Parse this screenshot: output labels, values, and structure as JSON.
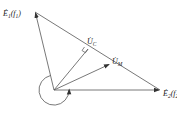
{
  "diagram": {
    "type": "phasor-diagram",
    "colors": {
      "stroke": "#444444",
      "text": "#222222",
      "background": "#ffffff"
    },
    "labels": {
      "e1": {
        "main": "Ė",
        "sub": "1",
        "suffix": "(f",
        "suffix_sub": "1",
        "close": ")"
      },
      "e2": {
        "main": "Ė",
        "sub": "2",
        "suffix": "(f",
        "suffix_sub": "2",
        "close": ")"
      },
      "uc": {
        "main": "U̇",
        "sub": "C"
      },
      "um": {
        "main": "U̇",
        "sub": "M"
      }
    },
    "vectors": [
      {
        "name": "E1",
        "from": [
          54,
          90
        ],
        "to": [
          35,
          12
        ]
      },
      {
        "name": "E2",
        "from": [
          54,
          90
        ],
        "to": [
          160,
          90
        ]
      },
      {
        "name": "UC",
        "from": [
          54,
          90
        ],
        "to": [
          88,
          49
        ]
      },
      {
        "name": "UM",
        "from": [
          54,
          90
        ],
        "to": [
          110,
          64
        ]
      }
    ],
    "connector": {
      "from": [
        35,
        12
      ],
      "to": [
        160,
        90
      ]
    },
    "rotation_arc": {
      "center": [
        54,
        90
      ],
      "radius": 15,
      "direction": "counter-clockwise"
    }
  }
}
